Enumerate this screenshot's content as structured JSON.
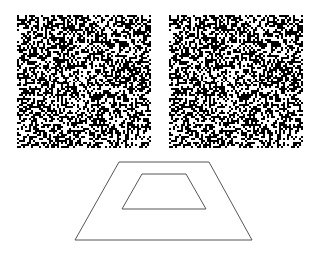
{
  "figure": {
    "stereogram": {
      "left": {
        "x": 17,
        "y": 15,
        "width": 134,
        "height": 133,
        "seed": 7
      },
      "right": {
        "x": 169,
        "y": 15,
        "width": 134,
        "height": 133,
        "seed": 7,
        "shifted_region": true
      },
      "dot_size": 2,
      "black_ratio": 0.5,
      "colors": {
        "dot": "#000000",
        "background": "#ffffff"
      }
    },
    "depth_illustration": {
      "outer_trapezoid": [
        [
          119,
          162
        ],
        [
          209,
          162
        ],
        [
          252,
          240
        ],
        [
          75,
          240
        ]
      ],
      "inner_trapezoid": [
        [
          142,
          174
        ],
        [
          186,
          174
        ],
        [
          206,
          209
        ],
        [
          122,
          209
        ]
      ],
      "stroke": "#555555",
      "stroke_width": 1
    }
  }
}
